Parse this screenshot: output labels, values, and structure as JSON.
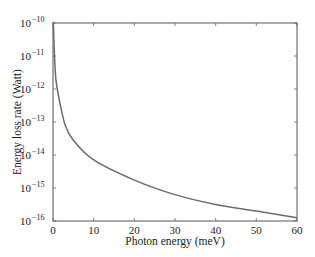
{
  "chart_data": {
    "type": "line",
    "title": "",
    "xlabel": "Photon energy (meV)",
    "ylabel": "Energy loss rate (Watt)",
    "xlim": [
      0,
      60
    ],
    "ylim": [
      1e-16,
      1e-10
    ],
    "yscale": "log",
    "grid": false,
    "legend": null,
    "x_ticks": [
      0,
      10,
      20,
      30,
      40,
      50,
      60
    ],
    "x_tick_labels": [
      "0",
      "10",
      "20",
      "30",
      "40",
      "50",
      "60"
    ],
    "y_ticks": [
      1e-10,
      1e-11,
      1e-12,
      1e-13,
      1e-14,
      1e-15,
      1e-16
    ],
    "y_tick_labels": [
      "10^-10",
      "10^-11",
      "10^-12",
      "10^-13",
      "10^-14",
      "10^-15",
      "10^-16"
    ],
    "series": [
      {
        "name": "energy loss rate",
        "color": "#6b6b6b",
        "x": [
          0.1,
          0.3,
          0.7,
          1.5,
          3,
          5,
          10,
          20,
          30,
          40,
          50,
          60
        ],
        "y_log10": [
          -10.05,
          -10.8,
          -11.7,
          -12.3,
          -13.1,
          -13.55,
          -14.15,
          -14.76,
          -15.2,
          -15.5,
          -15.7,
          -15.9
        ]
      }
    ]
  }
}
